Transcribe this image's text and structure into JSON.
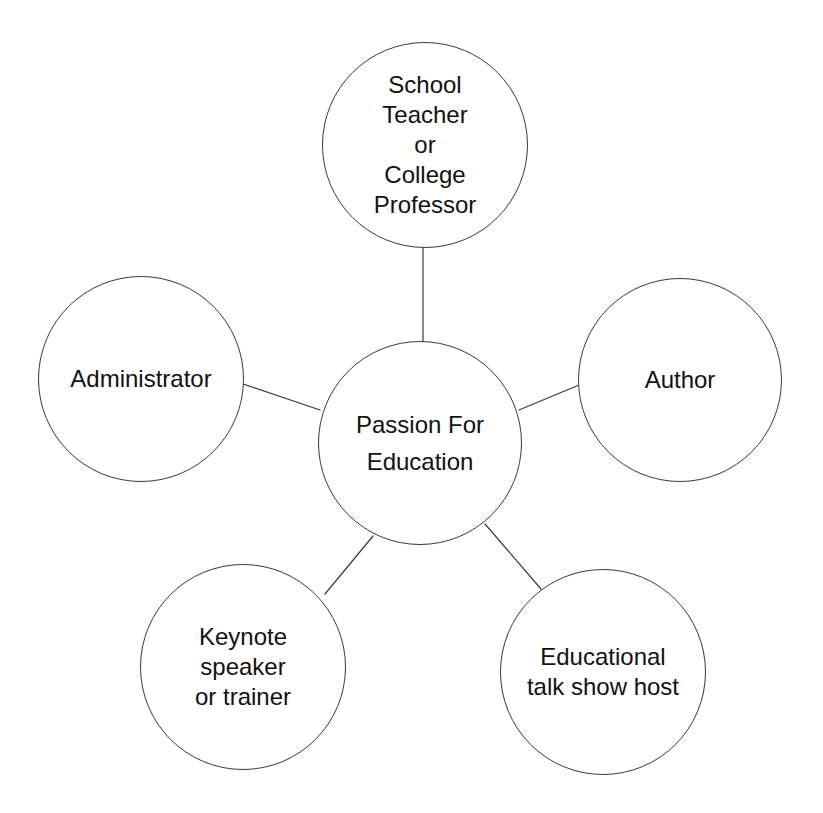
{
  "diagram": {
    "type": "hub-and-spoke",
    "title": "Passion For Education",
    "background_color": "#ffffff",
    "stroke_color": "#3a3a3a",
    "text_color": "#111111",
    "center": {
      "id": "center",
      "label": "Passion For\nEducation",
      "cx": 420,
      "cy": 443,
      "r": 102
    },
    "satellites": [
      {
        "id": "school-teacher-or-college-professor",
        "label": "School\nTeacher\nor\nCollege\nProfessor",
        "cx": 425,
        "cy": 145,
        "r": 103,
        "position": "top"
      },
      {
        "id": "administrator",
        "label": "Administrator",
        "cx": 141,
        "cy": 379,
        "r": 103,
        "position": "left"
      },
      {
        "id": "author",
        "label": "Author",
        "cx": 680,
        "cy": 380,
        "r": 102,
        "position": "right"
      },
      {
        "id": "keynote-speaker-or-trainer",
        "label": "Keynote\nspeaker\nor trainer",
        "cx": 243,
        "cy": 667,
        "r": 103,
        "position": "bottom-left"
      },
      {
        "id": "educational-talk-show-host",
        "label": "Educational\ntalk show host",
        "cx": 603,
        "cy": 672,
        "r": 103,
        "position": "bottom-right"
      }
    ],
    "connectors": [
      {
        "id": "center-to-school-teacher",
        "from": "center",
        "to": "school-teacher-or-college-professor",
        "x1": 423,
        "y1": 342,
        "x2": 423,
        "y2": 248
      },
      {
        "id": "center-to-administrator",
        "from": "center",
        "to": "administrator",
        "x1": 320,
        "y1": 410,
        "x2": 243,
        "y2": 384
      },
      {
        "id": "center-to-author",
        "from": "center",
        "to": "author",
        "x1": 519,
        "y1": 410,
        "x2": 579,
        "y2": 385
      },
      {
        "id": "center-to-keynote-speaker",
        "from": "center",
        "to": "keynote-speaker-or-trainer",
        "x1": 373,
        "y1": 536,
        "x2": 325,
        "y2": 594
      },
      {
        "id": "center-to-educational-talk-show-host",
        "from": "center",
        "to": "educational-talk-show-host",
        "x1": 485,
        "y1": 524,
        "x2": 541,
        "y2": 589
      }
    ]
  }
}
